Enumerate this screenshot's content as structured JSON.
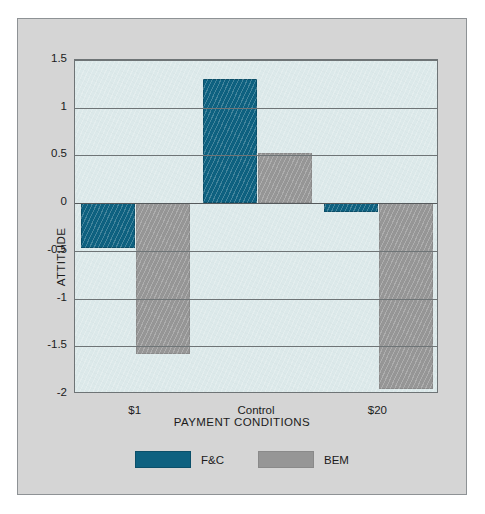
{
  "chart_data": {
    "type": "bar",
    "title": "",
    "xlabel": "PAYMENT CONDITIONS",
    "ylabel": "ATTITUDE",
    "categories": [
      "$1",
      "Control",
      "$20"
    ],
    "series": [
      {
        "name": "F&C",
        "color": "#0e6180",
        "values": [
          -0.47,
          1.3,
          -0.09
        ]
      },
      {
        "name": "BEM",
        "color": "#969696",
        "values": [
          -1.58,
          0.53,
          -1.95
        ]
      }
    ],
    "ylim": [
      -2,
      1.5
    ],
    "yticks": [
      1.5,
      1,
      0.5,
      0,
      -0.5,
      -1,
      -1.5,
      -2
    ],
    "ytick_labels": [
      "1.5",
      "1",
      "0.5",
      "0",
      "-0.5",
      "-1",
      "-1.5",
      "-2"
    ],
    "grid": true,
    "legend_position": "bottom",
    "plot_background": "#dce9ea",
    "figure_background": "#d5d5d5",
    "gridline_color": "#6e7476"
  }
}
